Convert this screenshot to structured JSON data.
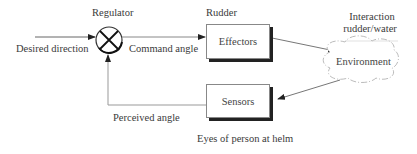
{
  "diagram": {
    "type": "control-loop block diagram",
    "nodes": {
      "regulator": {
        "label": "Regulator",
        "symbol": "summing-junction-cross"
      },
      "effectors": {
        "label": "Effectors",
        "caption": "Rudder"
      },
      "environment": {
        "label": "Environment",
        "caption_line1": "Interaction",
        "caption_line2": "rudder/water",
        "shape": "cloud"
      },
      "sensors": {
        "label": "Sensors",
        "caption": "Eyes of person at helm"
      }
    },
    "edges": {
      "input": {
        "label": "Desired direction",
        "from": "outside",
        "to": "regulator"
      },
      "command": {
        "label": "Command angle",
        "from": "regulator",
        "to": "effectors"
      },
      "effect": {
        "label": "",
        "from": "effectors",
        "to": "environment"
      },
      "sense": {
        "label": "",
        "from": "environment",
        "to": "sensors"
      },
      "feedback": {
        "label": "Perceived angle",
        "from": "sensors",
        "to": "regulator"
      }
    },
    "colors": {
      "line": "#555555",
      "shadow": "#222222",
      "text": "#3a3a3a"
    }
  }
}
